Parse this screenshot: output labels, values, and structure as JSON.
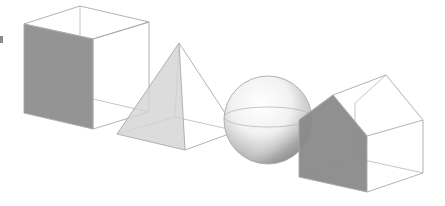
{
  "diagram": {
    "title": "",
    "shapes": [
      {
        "id": "cube",
        "label": "cube",
        "face_color": "#8c8c8c"
      },
      {
        "id": "pyramid",
        "label": "pyramid",
        "face_color": "#d6d6d6"
      },
      {
        "id": "sphere",
        "label": "sphere",
        "face_color": "#bdbdbd"
      },
      {
        "id": "house",
        "label": "house prism",
        "face_color": "#8a8a8a"
      }
    ],
    "colors": {
      "edge": "#a9a9a9",
      "background": "#ffffff"
    }
  }
}
